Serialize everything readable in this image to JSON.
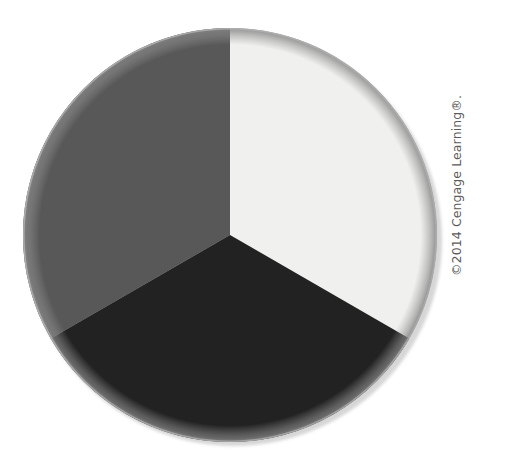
{
  "figure": {
    "background_color": "#ffffff",
    "width": 507,
    "height": 471,
    "alt_label": "three-equal-segment-pie-disc"
  },
  "copyright": {
    "text": "©2014 Cengage Learning®.",
    "color": "#5b5b5b",
    "rotation_degrees": -90
  },
  "chart_data": {
    "type": "pie",
    "title": "",
    "subtitle": "",
    "xlabel": "",
    "ylabel": "",
    "legend": "none",
    "grid": false,
    "center_x": 230,
    "center_y": 235,
    "radius": 207,
    "start_angle_degrees": 0,
    "direction": "clockwise",
    "categories": [
      "Segment 1",
      "Segment 2",
      "Segment 3"
    ],
    "values": [
      33.3,
      33.3,
      33.3
    ],
    "total": 100,
    "slices": [
      {
        "label": "Segment 1",
        "value": 33.3,
        "percent": "33.3%",
        "color": "#f0f0ee",
        "start_angle": 0,
        "end_angle": 120,
        "position": "top-right"
      },
      {
        "label": "Segment 2",
        "value": 33.3,
        "percent": "33.3%",
        "color": "#222222",
        "start_angle": 120,
        "end_angle": 240,
        "position": "bottom"
      },
      {
        "label": "Segment 3",
        "value": 33.3,
        "percent": "33.3%",
        "color": "#585858",
        "start_angle": 240,
        "end_angle": 360,
        "position": "left"
      }
    ],
    "outline_color": "#b4b4b4",
    "shadow_color": "#d0d0d0"
  }
}
